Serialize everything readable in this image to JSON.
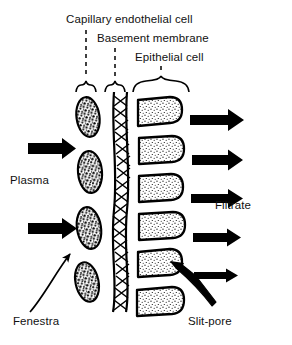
{
  "figure": {
    "background_color": "#ffffff",
    "ink_color": "#000000",
    "width": 292,
    "height": 345
  },
  "labels": {
    "capillary_endothelial_cell": "Capillary endothelial cell",
    "basement_membrane": "Basement membrane",
    "epithelial_cell": "Epithelial cell",
    "plasma": "Plasma",
    "filtrate": "Filtrate",
    "fenestra": "Fenestra",
    "slit_pore": "Slit-pore"
  },
  "layers": [
    {
      "name": "capillary endothelial cell",
      "column": "left",
      "style": "dark-stippled-oval",
      "count": 4,
      "gap_name": "fenestra"
    },
    {
      "name": "basement membrane",
      "column": "middle",
      "style": "braided-mesh-column",
      "count": 1
    },
    {
      "name": "epithelial cell",
      "column": "right",
      "style": "light-stippled-foot-process",
      "count": 6,
      "gap_name": "slit-pore"
    }
  ],
  "flow_arrows": {
    "inflow_label": "Plasma",
    "outflow_label": "Filtrate",
    "inflow_count": 2,
    "outflow_count": 5,
    "direction": "left-to-right",
    "note": "outflow arrows taper thinner toward the bottom"
  },
  "leader_lines": [
    {
      "label": "Capillary endothelial cell",
      "style": "dashed",
      "target": "left column brace"
    },
    {
      "label": "Basement membrane",
      "style": "dashed",
      "target": "middle column brace"
    },
    {
      "label": "Epithelial cell",
      "style": "dashed",
      "target": "right column brace"
    },
    {
      "label": "Fenestra",
      "style": "curved-arrow",
      "target": "gap between endothelial cells"
    },
    {
      "label": "Slit-pore",
      "style": "tapered-arrow",
      "target": "gap between epithelial cells"
    }
  ]
}
